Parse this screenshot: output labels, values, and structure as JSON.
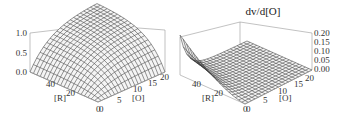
{
  "chart_data": [
    {
      "type": "surface3d",
      "title": "v",
      "x_axis": {
        "label": "[R]",
        "ticks": [
          "0",
          "20",
          "40"
        ],
        "range": [
          0,
          50
        ]
      },
      "y_axis": {
        "label": "[O]",
        "ticks": [
          "0",
          "5",
          "10",
          "15",
          "20"
        ],
        "range": [
          0,
          20
        ]
      },
      "z_axis": {
        "label": "",
        "ticks": [
          "0.0",
          "0.5",
          "1.0"
        ],
        "range": [
          0,
          1.0
        ]
      },
      "mesh": {
        "nx": 20,
        "ny": 20
      },
      "description": "Smooth saturating surface rising from 0 at the [R]=0,[O]=0 corner to ~1.0 at high [R] and high [O]",
      "grid": false,
      "legend": null
    },
    {
      "type": "surface3d",
      "title": "dv/d[O]",
      "x_axis": {
        "label": "[R]",
        "ticks": [
          "0",
          "20",
          "40"
        ],
        "range": [
          0,
          50
        ]
      },
      "y_axis": {
        "label": "[O]",
        "ticks": [
          "0",
          "5",
          "10",
          "15",
          "20"
        ],
        "range": [
          0,
          20
        ]
      },
      "z_axis": {
        "label": "",
        "ticks": [
          "0.00",
          "0.05",
          "0.10",
          "0.15",
          "0.20"
        ],
        "range": [
          0,
          0.2
        ]
      },
      "mesh": {
        "nx": 20,
        "ny": 20
      },
      "description": "Derivative surface: peaks near ~0.2 at low [O] and high [R], decays rapidly toward 0 as [O] increases",
      "grid": false,
      "legend": null
    }
  ],
  "plots": {
    "left": {
      "title": "v",
      "z_ticks": [
        "1.0",
        "0.5",
        "0.0"
      ],
      "r_ticks": [
        "40",
        "20",
        "0"
      ],
      "o_ticks": [
        "0",
        "5",
        "10",
        "15",
        "20"
      ],
      "r_label": "[R]",
      "o_label": "[O]"
    },
    "right": {
      "title": "dv/d[O]",
      "z_ticks": [
        "0.20",
        "0.15",
        "0.10",
        "0.05",
        "0.00"
      ],
      "r_ticks": [
        "40",
        "20",
        "0"
      ],
      "o_ticks": [
        "0",
        "5",
        "10",
        "15",
        "20"
      ],
      "r_label": "[R]",
      "o_label": "[O]"
    }
  }
}
